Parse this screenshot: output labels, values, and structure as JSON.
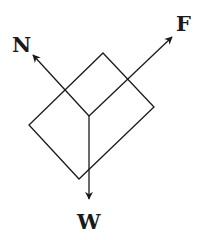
{
  "diagram": {
    "type": "free-body-diagram",
    "colors": {
      "stroke": "#1a1a1a",
      "background": "#ffffff"
    },
    "block": {
      "corners": [
        [
          103,
          53
        ],
        [
          154,
          107
        ],
        [
          79,
          179
        ],
        [
          29,
          125
        ]
      ]
    },
    "origin": [
      89,
      116
    ],
    "forces": [
      {
        "label": "N",
        "from": [
          89,
          116
        ],
        "to": [
          33,
          55
        ]
      },
      {
        "label": "F",
        "from": [
          89,
          116
        ],
        "to": [
          172,
          37
        ]
      },
      {
        "label": "W",
        "from": [
          89,
          116
        ],
        "to": [
          89,
          199
        ]
      }
    ]
  }
}
